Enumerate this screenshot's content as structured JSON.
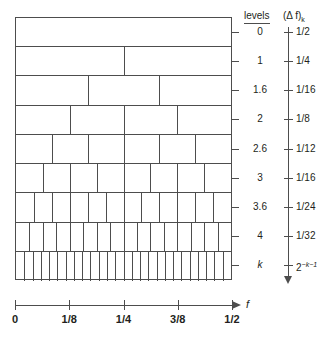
{
  "chart_data": {
    "type": "bar",
    "title": "",
    "subtitle": "",
    "xlabel": "f",
    "ylabel": "",
    "xlim": [
      0,
      0.5
    ],
    "grid": false,
    "legend": null,
    "columns": {
      "levels_header": "levels",
      "delta_f_header": "(Δ f)",
      "delta_f_header_sub": "k"
    },
    "rows": [
      {
        "level": "0",
        "delta_f": "1/2",
        "bands": 1,
        "dividers": []
      },
      {
        "level": "1",
        "delta_f": "1/4",
        "bands": 2,
        "dividers": [
          0.5
        ]
      },
      {
        "level": "1.6",
        "delta_f": "1/16",
        "bands": 3,
        "dividers": [
          0.3333,
          0.6667
        ]
      },
      {
        "level": "2",
        "delta_f": "1/8",
        "bands": 4,
        "dividers": [
          0.25,
          0.5,
          0.75
        ]
      },
      {
        "level": "2.6",
        "delta_f": "1/12",
        "bands": 6,
        "dividers": [
          0.1667,
          0.3333,
          0.5,
          0.6667,
          0.8333
        ]
      },
      {
        "level": "3",
        "delta_f": "1/16",
        "bands": 8,
        "dividers": [
          0.125,
          0.25,
          0.375,
          0.5,
          0.625,
          0.75,
          0.875
        ]
      },
      {
        "level": "3.6",
        "delta_f": "1/24",
        "bands": 12,
        "dividers": [
          0.0833,
          0.1667,
          0.25,
          0.3333,
          0.4167,
          0.5,
          0.5833,
          0.6667,
          0.75,
          0.8333,
          0.9167
        ]
      },
      {
        "level": "4",
        "delta_f": "1/32",
        "bands": 16,
        "dividers": [
          0.0625,
          0.125,
          0.1875,
          0.25,
          0.3125,
          0.375,
          0.4375,
          0.5,
          0.5625,
          0.625,
          0.6875,
          0.75,
          0.8125,
          0.875,
          0.9375
        ]
      },
      {
        "level": "k",
        "delta_f": "2",
        "delta_f_sup": "−k−1",
        "bands": 26,
        "dividers": [
          0.0385,
          0.0769,
          0.1154,
          0.1538,
          0.1923,
          0.2308,
          0.2692,
          0.3077,
          0.3462,
          0.3846,
          0.4231,
          0.4615,
          0.5,
          0.5385,
          0.5769,
          0.6154,
          0.6538,
          0.6923,
          0.7308,
          0.7692,
          0.8077,
          0.8462,
          0.8846,
          0.9231,
          0.9615
        ]
      }
    ],
    "x_ticks": [
      {
        "pos": 0.0,
        "label": "0"
      },
      {
        "pos": 0.25,
        "label": "1/8"
      },
      {
        "pos": 0.5,
        "label": "1/4"
      },
      {
        "pos": 0.75,
        "label": "3/8"
      },
      {
        "pos": 1.0,
        "label": "1/2"
      }
    ],
    "axis_colors": {
      "line": "#4d4d4d",
      "text": "#231f20",
      "background": "#ffffff"
    }
  }
}
